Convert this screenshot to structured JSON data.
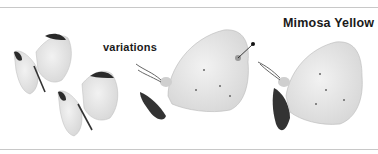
{
  "plate": {
    "title": "Mimosa Yellow",
    "variations_label": "variations",
    "colors": {
      "background": "#ffffff",
      "wing": "#e4e4e4",
      "wing_tip": "#2a2a2a",
      "rule": "#c8c8c8",
      "text": "#1a1a1a"
    },
    "figures": [
      {
        "name": "butterfly-open-upper",
        "view": "dorsal, wings open"
      },
      {
        "name": "butterfly-open-lower",
        "view": "dorsal, wings open"
      },
      {
        "name": "butterfly-side-perched-left",
        "view": "ventral, perched, with pointer marker"
      },
      {
        "name": "butterfly-side-perched-right",
        "view": "ventral, perched"
      }
    ]
  }
}
